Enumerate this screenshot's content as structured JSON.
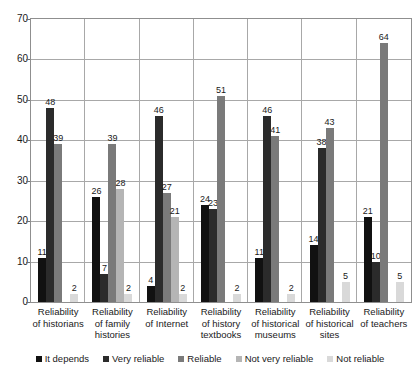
{
  "chart_data": {
    "type": "bar",
    "title": "",
    "subtitle": "",
    "xlabel": "",
    "ylabel": "",
    "ylim": [
      0,
      70
    ],
    "ytick_step": 10,
    "yticks": [
      70,
      60,
      50,
      40,
      30,
      20,
      10,
      0
    ],
    "grid": true,
    "legend_position": "bottom",
    "categories": [
      "Reliability of historians",
      "Reliability of family histories",
      "Reliability of Internet",
      "Reliability of history textbooks",
      "Reliability of historical museums",
      "Reliability of historical sites",
      "Reliability of teachers"
    ],
    "series": [
      {
        "name": "It depends",
        "color": "#111111",
        "values": [
          11,
          26,
          4,
          24,
          11,
          14,
          21
        ]
      },
      {
        "name": "Very reliable",
        "color": "#2b2b2b",
        "values": [
          48,
          7,
          46,
          23,
          46,
          38,
          10
        ]
      },
      {
        "name": "Reliable",
        "color": "#7a7a7a",
        "values": [
          39,
          39,
          27,
          51,
          41,
          43,
          64
        ]
      },
      {
        "name": "Not very reliable",
        "color": "#b5b5b5",
        "values": [
          0,
          28,
          21,
          0,
          0,
          0,
          0
        ]
      },
      {
        "name": "Not reliable",
        "color": "#d9d9d9",
        "values": [
          2,
          2,
          2,
          2,
          2,
          5,
          5
        ]
      }
    ]
  },
  "axis": {
    "y_ticks": [
      "70",
      "60",
      "50",
      "40",
      "30",
      "20",
      "10",
      "0"
    ]
  },
  "categories_display": [
    {
      "line1": "Reliability",
      "line2": "of historians",
      "line3": ""
    },
    {
      "line1": "Reliability",
      "line2": "of family",
      "line3": "histories"
    },
    {
      "line1": "Reliability",
      "line2": "of Internet",
      "line3": ""
    },
    {
      "line1": "Reliability",
      "line2": "of history",
      "line3": "textbooks"
    },
    {
      "line1": "Reliability",
      "line2": "of historical",
      "line3": "museums"
    },
    {
      "line1": "Reliability",
      "line2": "of historical",
      "line3": "sites"
    },
    {
      "line1": "Reliability",
      "line2": "of teachers",
      "line3": ""
    }
  ],
  "legend": {
    "items": [
      {
        "label": "It depends",
        "color": "#111111"
      },
      {
        "label": "Very reliable",
        "color": "#2b2b2b"
      },
      {
        "label": "Reliable",
        "color": "#7a7a7a"
      },
      {
        "label": "Not very reliable",
        "color": "#b5b5b5"
      },
      {
        "label": "Not reliable",
        "color": "#d9d9d9"
      }
    ]
  }
}
